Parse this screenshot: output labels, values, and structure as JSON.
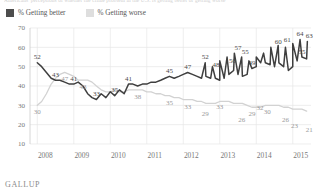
{
  "headline": {
    "text": "Americans' perceptions of whether the crime problem in the U.S. is getting better or getting worse"
  },
  "legend": {
    "position": "top-left",
    "items": [
      {
        "label": "% Getting better",
        "color": "#4d4d4d",
        "icon": "square-swatch"
      },
      {
        "label": "% Getting worse",
        "color": "#dedede",
        "icon": "square-swatch"
      }
    ]
  },
  "source": "GALLUP",
  "chart_data": {
    "type": "line",
    "title": "",
    "subtitle": "",
    "xlabel": "",
    "ylabel": "",
    "xlim": [
      2007.8,
      2015.5
    ],
    "ylim": [
      10,
      70
    ],
    "yticks": [
      10,
      20,
      30,
      40,
      50,
      60,
      70
    ],
    "xticks": [
      2008,
      2009,
      2010,
      2011,
      2012,
      2013,
      2014,
      2015
    ],
    "grid": true,
    "legend_position": "top-left",
    "x": [
      2008.0,
      2008.12,
      2008.25,
      2008.38,
      2008.5,
      2008.62,
      2008.75,
      2008.88,
      2009.0,
      2009.12,
      2009.25,
      2009.38,
      2009.5,
      2009.62,
      2009.75,
      2009.88,
      2010.0,
      2010.12,
      2010.25,
      2010.38,
      2010.5,
      2010.62,
      2010.75,
      2010.88,
      2011.0,
      2011.12,
      2011.25,
      2011.38,
      2011.5,
      2011.62,
      2011.75,
      2011.88,
      2012.0,
      2012.12,
      2012.25,
      2012.38,
      2012.5,
      2012.62,
      2012.75,
      2012.88,
      2013.0,
      2013.12,
      2013.25,
      2013.38,
      2013.5,
      2013.62,
      2013.75,
      2013.88,
      2014.0,
      2014.12,
      2014.25,
      2014.38,
      2014.5,
      2014.62,
      2014.75,
      2014.88,
      2015.0,
      2015.12,
      2015.25,
      2015.38
    ],
    "series": [
      {
        "name": "% Getting better",
        "color": "#3f3f3f",
        "values": [
          52,
          50,
          47,
          44,
          43,
          43,
          42,
          41,
          41,
          42,
          40,
          36,
          34,
          33,
          36,
          34,
          37,
          35,
          38,
          36,
          41,
          41,
          40,
          41,
          41,
          42,
          42,
          43,
          44,
          45,
          44,
          45,
          46,
          47,
          46,
          45,
          44,
          45,
          44,
          44,
          43,
          44,
          46,
          48,
          46,
          45,
          46,
          49,
          50,
          52,
          52,
          51,
          50,
          52,
          50,
          48,
          50,
          53,
          55,
          54
        ],
        "labeled_points": [
          {
            "x": 2008.0,
            "value": 52
          },
          {
            "x": 2008.5,
            "value": 43
          },
          {
            "x": 2009.0,
            "value": 41
          },
          {
            "x": 2009.62,
            "value": 33
          },
          {
            "x": 2010.12,
            "value": 35
          },
          {
            "x": 2010.5,
            "value": 41
          },
          {
            "x": 2011.62,
            "value": 45
          },
          {
            "x": 2012.12,
            "value": 47
          },
          {
            "x": 2013.88,
            "value": 49
          },
          {
            "x": 2015.25,
            "value": 55
          }
        ]
      },
      {
        "name": "% Getting worse",
        "color": "#d2d2d2",
        "values": [
          30,
          32,
          36,
          41,
          44,
          46,
          47,
          46,
          45,
          43,
          43,
          43,
          42,
          40,
          38,
          37,
          37,
          38,
          37,
          37,
          38,
          38,
          38,
          38,
          37,
          37,
          36,
          36,
          35,
          35,
          34,
          34,
          33,
          33,
          33,
          32,
          32,
          31,
          31,
          31,
          32,
          32,
          32,
          31,
          31,
          31,
          30,
          29,
          29,
          29,
          30,
          30,
          30,
          30,
          29,
          29,
          28,
          28,
          28,
          27
        ],
        "labeled_points": [
          {
            "x": 2008.0,
            "value": 30
          },
          {
            "x": 2008.75,
            "value": 47
          },
          {
            "x": 2009.25,
            "value": 43
          },
          {
            "x": 2010.75,
            "value": 38
          },
          {
            "x": 2011.62,
            "value": 35
          },
          {
            "x": 2012.12,
            "value": 33
          },
          {
            "x": 2013.88,
            "value": 29
          }
        ]
      }
    ],
    "right_segment": {
      "better": {
        "x": [
          2012.6,
          2012.8,
          2013.0,
          2013.2,
          2013.4,
          2013.6,
          2013.8,
          2014.0,
          2014.2,
          2014.4,
          2014.6,
          2014.8,
          2015.0,
          2015.2,
          2015.4
        ],
        "values": [
          52,
          50,
          53,
          55,
          57,
          55,
          53,
          55,
          57,
          60,
          61,
          60,
          62,
          64,
          63
        ],
        "labeled_points": [
          {
            "x": 2012.6,
            "value": 52
          },
          {
            "x": 2012.9,
            "value": 48
          },
          {
            "x": 2013.5,
            "value": 57
          },
          {
            "x": 2013.35,
            "value": 50
          },
          {
            "x": 2013.7,
            "value": 55
          },
          {
            "x": 2014.6,
            "value": 60
          },
          {
            "x": 2014.85,
            "value": 61
          },
          {
            "x": 2015.2,
            "value": 64
          },
          {
            "x": 2015.45,
            "value": 63
          }
        ]
      },
      "worse": {
        "labeled_points": [
          {
            "x": 2012.6,
            "value": 29
          },
          {
            "x": 2013.0,
            "value": 33
          },
          {
            "x": 2013.6,
            "value": 26
          },
          {
            "x": 2014.1,
            "value": 32
          },
          {
            "x": 2014.3,
            "value": 30
          },
          {
            "x": 2014.8,
            "value": 26
          },
          {
            "x": 2015.05,
            "value": 23
          },
          {
            "x": 2015.45,
            "value": 21
          }
        ]
      }
    }
  }
}
